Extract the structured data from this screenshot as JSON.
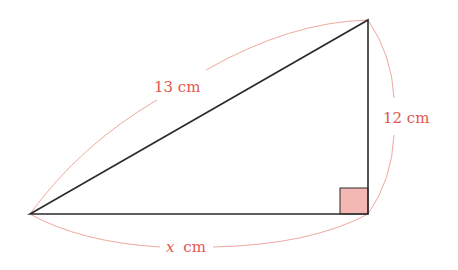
{
  "diagram": {
    "type": "right-triangle",
    "vertices": {
      "left": [
        30,
        214
      ],
      "top": [
        368,
        20
      ],
      "right_angle": [
        368,
        214
      ]
    },
    "sides": {
      "hypotenuse": {
        "label": "13 cm",
        "value": 13,
        "unit": "cm"
      },
      "vertical_leg": {
        "label": "12 cm",
        "value": 12,
        "unit": "cm"
      },
      "horizontal_leg": {
        "variable": "x",
        "unit_label": "cm",
        "unit": "cm"
      }
    },
    "right_angle_marker": true,
    "colors": {
      "triangle_stroke": "#2b2b2b",
      "label_color": "#e0574f",
      "arc_color": "#f0a89f",
      "right_angle_fill": "#f3b8b3"
    }
  }
}
